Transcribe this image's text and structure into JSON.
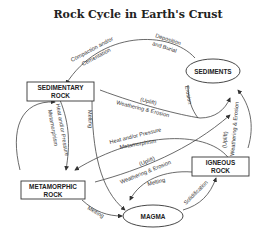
{
  "title": "Rock Cycle in Earth's Crust",
  "nodes": {
    "sediments": {
      "label": "SEDIMENTS"
    },
    "sedimentary": {
      "line1": "SEDIMENTARY",
      "line2": "ROCK"
    },
    "metamorphic": {
      "line1": "METAMORPHIC",
      "line2": "ROCK"
    },
    "igneous": {
      "line1": "IGNEOUS",
      "line2": "ROCK"
    },
    "magma": {
      "label": "MAGMA"
    }
  },
  "edges": {
    "deposition": {
      "line1": "Deposition",
      "line2": "and Burial"
    },
    "compaction": {
      "line1": "Compaction and/or",
      "line2": "Cementation"
    },
    "sed_weathering": {
      "line1": "(Uplift)",
      "line2": "Weathering & Erosion"
    },
    "erosion": {
      "label": "Erosion"
    },
    "ign_weathering": {
      "line1": "(Uplift)",
      "line2": "Weathering & Erosion"
    },
    "heat_pressure_sed": {
      "line1": "Heat and/or Pressure",
      "line2": "Metamorphism"
    },
    "sed_melting": {
      "label": "Melting"
    },
    "heat_pressure_ign": {
      "line1": "Heat and/or Pressure",
      "line2": "Metamorphism"
    },
    "met_weathering": {
      "line1": "(Uplift)",
      "line2": "Weathering & Erosion"
    },
    "ign_melting": {
      "label": "Melting"
    },
    "met_melting": {
      "label": "Melting"
    },
    "solidification": {
      "label": "Solidification"
    }
  }
}
